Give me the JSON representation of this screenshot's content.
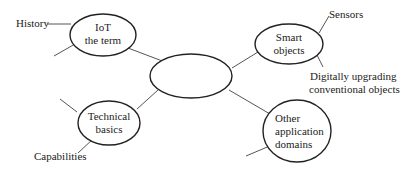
{
  "diagram": {
    "type": "mind-map",
    "center": {
      "label": ""
    },
    "nodes": [
      {
        "id": "iot-term",
        "lines": [
          "IoT",
          "the term"
        ],
        "branches": [
          "History",
          ""
        ]
      },
      {
        "id": "smart-objects",
        "lines": [
          "Smart",
          "objects"
        ],
        "branches": [
          "Sensors",
          "Digitally upgrading conventional objects"
        ]
      },
      {
        "id": "technical-basics",
        "lines": [
          "Technical",
          "basics"
        ],
        "branches": [
          "",
          "Capabilities"
        ]
      },
      {
        "id": "other-domains",
        "lines": [
          "Other",
          "application",
          "domains"
        ],
        "branches": [
          ""
        ]
      }
    ],
    "branch_labels": {
      "history": "History",
      "sensors": "Sensors",
      "digitally_1": "Digitally upgrading",
      "digitally_2": "conventional objects",
      "capabilities": "Capabilities"
    },
    "colors": {
      "stroke": "#222222",
      "connector": "#555555",
      "background": "#ffffff"
    }
  }
}
